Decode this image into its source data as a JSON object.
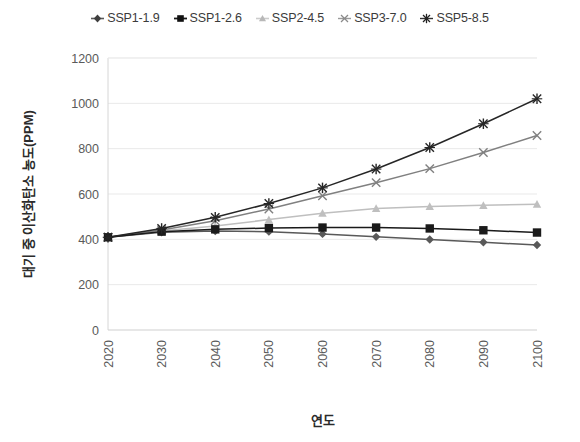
{
  "chart_data": {
    "type": "line",
    "title": "",
    "xlabel": "연도",
    "ylabel": "대기 중 이산화탄소 농도(PPM)",
    "x": [
      2020,
      2030,
      2040,
      2050,
      2060,
      2070,
      2080,
      2090,
      2100
    ],
    "xticklabels": [
      "2020",
      "2030",
      "2040",
      "2050",
      "2060",
      "2070",
      "2080",
      "2090",
      "2100"
    ],
    "yticklabels": [
      "0",
      "200",
      "400",
      "600",
      "800",
      "1000",
      "1200"
    ],
    "yticks": [
      0,
      200,
      400,
      600,
      800,
      1000,
      1200
    ],
    "ylim": [
      0,
      1200
    ],
    "xlim": [
      2020,
      2100
    ],
    "grid": "horizontal",
    "legend_position": "top-center",
    "series": [
      {
        "name": "SSP1-1.9",
        "marker": "diamond",
        "color": "#595959",
        "values": [
          409,
          431,
          437,
          434,
          424,
          411,
          399,
          387,
          375
        ]
      },
      {
        "name": "SSP1-2.6",
        "marker": "square",
        "color": "#1a1a1a",
        "values": [
          409,
          434,
          444,
          450,
          452,
          452,
          448,
          440,
          430
        ]
      },
      {
        "name": "SSP2-4.5",
        "marker": "triangle",
        "color": "#bfbfbf",
        "values": [
          409,
          437,
          459,
          487,
          515,
          536,
          545,
          550,
          555
        ]
      },
      {
        "name": "SSP3-7.0",
        "marker": "x",
        "color": "#808080",
        "values": [
          409,
          441,
          482,
          534,
          592,
          650,
          712,
          783,
          858
        ]
      },
      {
        "name": "SSP5-8.5",
        "marker": "asterisk",
        "color": "#262626",
        "values": [
          409,
          448,
          497,
          558,
          627,
          710,
          805,
          910,
          1020
        ]
      }
    ]
  },
  "axis": {
    "y_title": "대기 중 이산화탄소 농도(PPM)",
    "x_title": "연도"
  }
}
